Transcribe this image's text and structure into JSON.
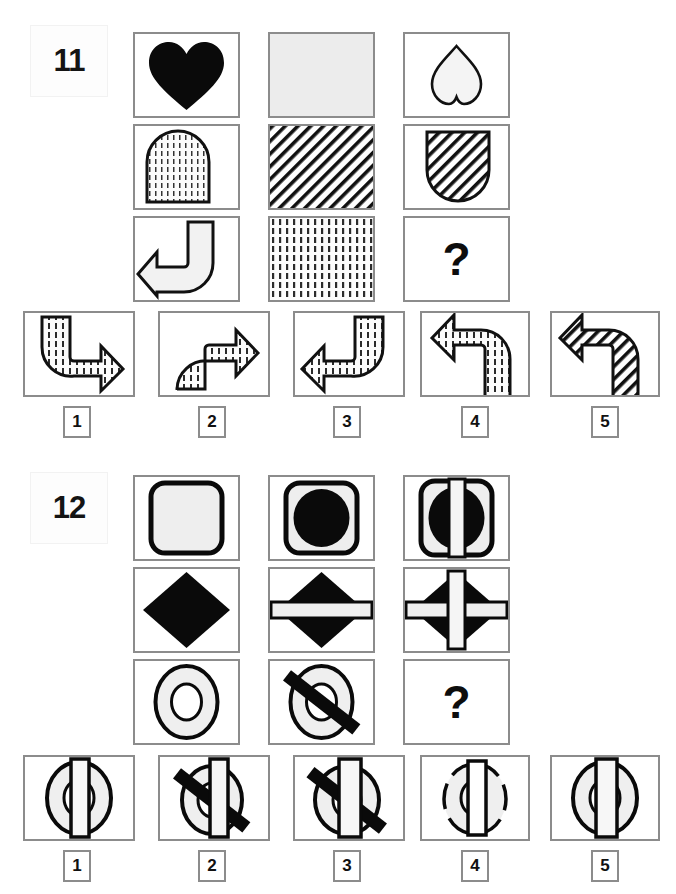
{
  "page": {
    "background": "#ffffff",
    "border_color": "#8c8c8c",
    "ink_color": "#000000",
    "fill_light": "#f0f0f0"
  },
  "puzzles": [
    {
      "number": "11",
      "matrix": {
        "rows": [
          [
            {
              "name": "heart-solid",
              "desc": "solid black heart"
            },
            {
              "name": "square-plain-gray",
              "desc": "plain light gray square"
            },
            {
              "name": "heart-outline",
              "desc": "outlined heart, point up"
            }
          ],
          [
            {
              "name": "arch-dotted",
              "desc": "arch shape with dot fill"
            },
            {
              "name": "square-diagonal-hatch",
              "desc": "full square diagonal hatch"
            },
            {
              "name": "arch-inverted-hatch",
              "desc": "inverted arch with diagonal hatch"
            }
          ],
          [
            {
              "name": "arrow-curved-left-plain",
              "desc": "curved arrow pointing left, no fill"
            },
            {
              "name": "square-vertical-dash",
              "desc": "full square vertical dash fill"
            },
            {
              "name": "question-cell",
              "desc": "missing piece",
              "label": "?"
            }
          ]
        ]
      },
      "options": [
        {
          "number": "1",
          "name": "arrow-down-right-dash",
          "desc": "curved arrow pointing right, dash fill"
        },
        {
          "number": "2",
          "name": "arrow-up-right-dash",
          "desc": "curved arrow up then right, dash fill"
        },
        {
          "number": "3",
          "name": "arrow-down-left-dash",
          "desc": "curved arrow pointing left, dash fill"
        },
        {
          "number": "4",
          "name": "arrow-up-left-dash",
          "desc": "curved arrow pointing left upper, dash fill"
        },
        {
          "number": "5",
          "name": "arrow-up-left-hatch",
          "desc": "curved arrow pointing left upper, diagonal hatch"
        }
      ]
    },
    {
      "number": "12",
      "matrix": {
        "rows": [
          [
            {
              "name": "rounded-square-empty",
              "desc": "rounded square outline, empty"
            },
            {
              "name": "rounded-square-circle",
              "desc": "rounded square with black circle"
            },
            {
              "name": "rounded-square-circle-vbar",
              "desc": "rounded square, black circle, vertical white bar"
            }
          ],
          [
            {
              "name": "diamond-solid",
              "desc": "solid black diamond"
            },
            {
              "name": "diamond-hbar",
              "desc": "black diamond with horizontal white bar"
            },
            {
              "name": "diamond-cross-bars",
              "desc": "black diamond with horizontal and vertical white bars"
            }
          ],
          [
            {
              "name": "ring-plain",
              "desc": "ring / donut outline"
            },
            {
              "name": "ring-slash",
              "desc": "ring with diagonal black slash"
            },
            {
              "name": "question-cell",
              "desc": "missing piece",
              "label": "?"
            }
          ]
        ]
      },
      "options": [
        {
          "number": "1",
          "name": "ring-vbar",
          "desc": "ring with vertical white bar"
        },
        {
          "number": "2",
          "name": "ring-slash-vbar-narrow",
          "desc": "ring with slash and narrow vertical bar"
        },
        {
          "number": "3",
          "name": "ring-slash-vbar-wide",
          "desc": "ring with slash and wide vertical bar"
        },
        {
          "number": "4",
          "name": "ring-broken-vbar",
          "desc": "broken ring with narrow vertical bar"
        },
        {
          "number": "5",
          "name": "ring-vbar-wide",
          "desc": "ring with wide vertical bar"
        }
      ]
    }
  ]
}
